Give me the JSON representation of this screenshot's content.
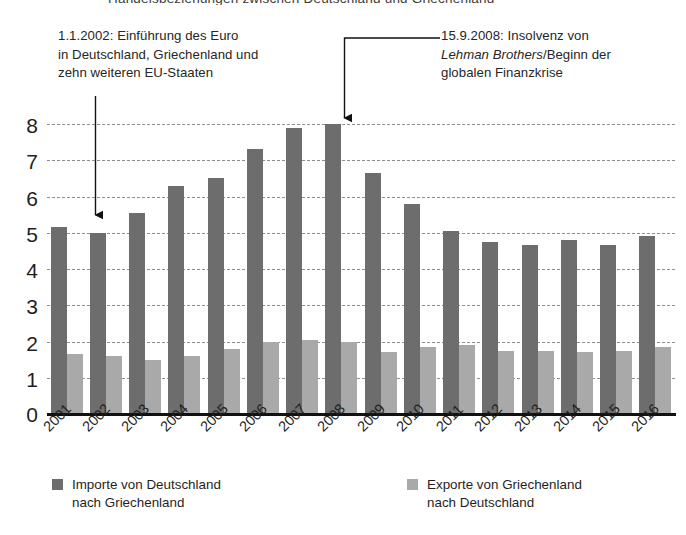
{
  "title_clipped": "Handelsbeziehungen zwischen Deutschland und Griechenland",
  "annotations": [
    {
      "id": "euro",
      "line1": "1.1.2002: Einführung des Euro",
      "line2": "in Deutschland, Griechenland und",
      "line3": "zehn weiteren EU-Staaten",
      "target_year": "2002"
    },
    {
      "id": "lehman",
      "line1": "15.9.2008: Insolvenz von",
      "line2_italic": "Lehman Brothers",
      "line2_rest": "/Beginn der",
      "line3": "globalen Finanzkrise",
      "target_year": "2008"
    }
  ],
  "legend": {
    "import_label": "Importe von Deutschland\nnach Griechenland",
    "export_label": "Exporte von Griechenland\nnach Deutschland",
    "import_color": "#6d6d6d",
    "export_color": "#a9a9a9"
  },
  "chart_data": {
    "type": "bar",
    "title": "Handelsbeziehungen zwischen Deutschland und Griechenland",
    "xlabel": "",
    "ylabel": "",
    "ylim": [
      0,
      8
    ],
    "yticks": [
      0,
      1,
      2,
      3,
      4,
      5,
      6,
      7,
      8
    ],
    "ytick_labels": [
      "0",
      "1",
      "2",
      "3",
      "4",
      "5",
      "6",
      "7",
      "8"
    ],
    "grid": true,
    "legend_position": "bottom",
    "categories": [
      "2001",
      "2002",
      "2003",
      "2004",
      "2005",
      "2006",
      "2007",
      "2008",
      "2009",
      "2010",
      "2011",
      "2012",
      "2013",
      "2014",
      "2015",
      "2016"
    ],
    "series": [
      {
        "name": "Importe von Deutschland nach Griechenland",
        "color": "#6d6d6d",
        "values": [
          5.15,
          5.0,
          5.55,
          6.3,
          6.5,
          7.3,
          7.9,
          8.0,
          6.65,
          5.8,
          5.05,
          4.75,
          4.65,
          4.8,
          4.65,
          4.9
        ]
      },
      {
        "name": "Exporte von Griechenland nach Deutschland",
        "color": "#a9a9a9",
        "values": [
          1.65,
          1.6,
          1.5,
          1.6,
          1.8,
          2.0,
          2.05,
          2.0,
          1.7,
          1.85,
          1.9,
          1.75,
          1.75,
          1.7,
          1.75,
          1.85
        ]
      }
    ],
    "annotations": [
      {
        "year": "2002",
        "text": "1.1.2002: Einführung des Euro in Deutschland, Griechenland und zehn weiteren EU-Staaten"
      },
      {
        "year": "2008",
        "text": "15.9.2008: Insolvenz von Lehman Brothers / Beginn der globalen Finanzkrise"
      }
    ]
  }
}
